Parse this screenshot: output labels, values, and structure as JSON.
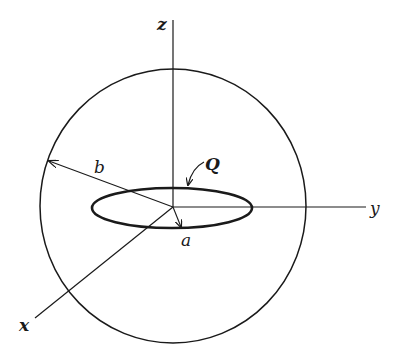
{
  "diagram": {
    "colors": {
      "stroke": "#1a1a1a",
      "background": "#ffffff"
    },
    "axes": {
      "x": {
        "label": "x"
      },
      "y": {
        "label": "y"
      },
      "z": {
        "label": "z"
      }
    },
    "sphere": {
      "radius_label": "b"
    },
    "ring": {
      "radius_label": "a",
      "charge_label": "Q"
    }
  }
}
